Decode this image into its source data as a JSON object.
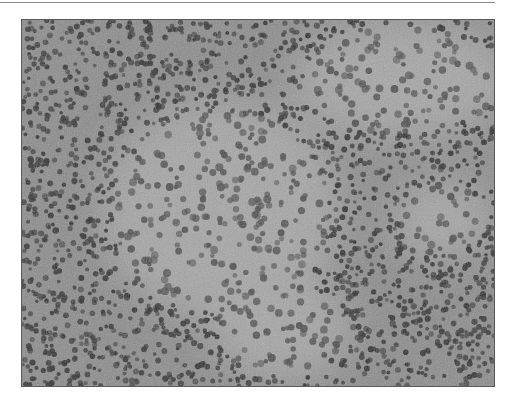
{
  "figure": {
    "colors": {
      "background": "#ffffff",
      "tissue_base": "#8c8c8c",
      "pale_region": "#a6a6a6",
      "nucleus_dark": "#2e2e2e",
      "nucleus_mid": "#4a4a4a",
      "rule": "#8a8a8a"
    },
    "pale_regions": [
      {
        "cx": 200,
        "cy": 190,
        "rx": 120,
        "ry": 110
      },
      {
        "cx": 380,
        "cy": 60,
        "rx": 110,
        "ry": 60
      },
      {
        "cx": 260,
        "cy": 310,
        "rx": 70,
        "ry": 50
      },
      {
        "cx": 420,
        "cy": 200,
        "rx": 50,
        "ry": 40
      }
    ]
  }
}
